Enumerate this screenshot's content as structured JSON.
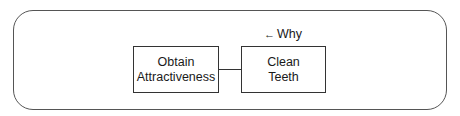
{
  "diagram": {
    "nodes": [
      {
        "id": "left",
        "label": "Obtain\nAttractiveness"
      },
      {
        "id": "right",
        "label": "Clean\nTeeth"
      }
    ],
    "edges": [
      {
        "from": "left",
        "to": "right",
        "style": "line"
      }
    ],
    "annotation": {
      "arrow": "←",
      "label": "Why"
    }
  }
}
